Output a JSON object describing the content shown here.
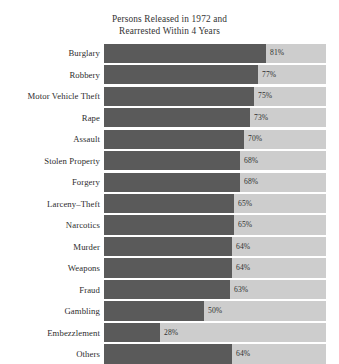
{
  "page_artifact": "",
  "chart": {
    "title_lines": [
      "Persons Released in 1972 and",
      "Rearrested Within 4 Years"
    ],
    "colors": {
      "bar_fill": "#5a5a5a",
      "bar_track": "#cdcdcd",
      "text": "#2d2d2d",
      "background": "#ffffff"
    }
  },
  "chart_data": {
    "type": "bar",
    "orientation": "horizontal",
    "title": "Persons Released in 1972 and Rearrested Within 4 Years",
    "xlabel": "",
    "ylabel": "",
    "xlim": [
      0,
      111
    ],
    "grid": false,
    "legend": null,
    "value_suffix": "%",
    "categories": [
      "Burglary",
      "Robbery",
      "Motor Vehicle Theft",
      "Rape",
      "Assault",
      "Stolen Property",
      "Forgery",
      "Larceny–Theft",
      "Narcotics",
      "Murder",
      "Weapons",
      "Fraud",
      "Gambling",
      "Embezzlement",
      "Others"
    ],
    "values": [
      81,
      77,
      75,
      73,
      70,
      68,
      68,
      65,
      65,
      64,
      64,
      63,
      50,
      28,
      64
    ],
    "value_labels": [
      "81%",
      "77%",
      "75%",
      "73%",
      "70%",
      "68%",
      "68%",
      "65%",
      "65%",
      "64%",
      "64%",
      "63%",
      "50%",
      "28%",
      "64%"
    ]
  }
}
